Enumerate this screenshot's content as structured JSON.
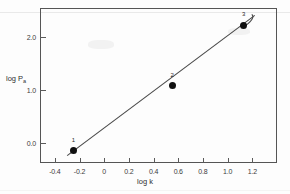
{
  "chart_data": {
    "type": "scatter",
    "title": "",
    "xlabel": "log k",
    "ylabel": "log Pₐ",
    "ylabel_base": "log P",
    "ylabel_sub": "a",
    "xlim": [
      -0.52,
      1.4
    ],
    "ylim": [
      -0.38,
      2.55
    ],
    "grid": false,
    "legend": null,
    "xticks": [
      -0.4,
      -0.2,
      0,
      0.2,
      0.4,
      0.6,
      0.8,
      1.0,
      1.2
    ],
    "xticklabels": [
      "-0.4",
      "-0.2",
      "0",
      "0.2",
      "0.4",
      "0.6",
      "0.8",
      "1.0",
      "1.2"
    ],
    "yticks": [
      0.0,
      1.0,
      2.0
    ],
    "yticklabels": [
      "0.0",
      "1.0",
      "2.0"
    ],
    "points": [
      {
        "label": "1",
        "x": -0.25,
        "y": -0.15
      },
      {
        "label": "2",
        "x": 0.55,
        "y": 1.08
      },
      {
        "label": "3",
        "x": 1.13,
        "y": 2.22
      }
    ],
    "fit_line": {
      "type": "line",
      "x": [
        -0.3,
        1.22
      ],
      "y": [
        -0.24,
        2.41
      ]
    },
    "colors": {
      "marker": "#101010",
      "line": "#4a4a4a",
      "frame": "#555555",
      "text": "#2f2f2f",
      "background": "#fdfdfd"
    }
  },
  "figure": {
    "frame_label": "plot frame",
    "artifact_note": "scanned figure"
  }
}
